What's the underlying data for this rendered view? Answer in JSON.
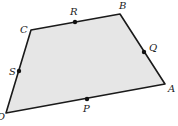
{
  "diagram": {
    "type": "quadrilateral",
    "fill_color": "#e6e6e6",
    "stroke_color": "#1a1a1a",
    "vertices": [
      {
        "label": "A",
        "x": 165,
        "y": 84,
        "lx": 168,
        "ly": 92
      },
      {
        "label": "B",
        "x": 120,
        "y": 14,
        "lx": 119,
        "ly": 9
      },
      {
        "label": "C",
        "x": 31,
        "y": 30,
        "lx": 20,
        "ly": 33
      },
      {
        "label": "D",
        "x": 6,
        "y": 113,
        "lx": -3,
        "ly": 120
      }
    ],
    "midpoints": [
      {
        "label": "P",
        "x": 87,
        "y": 99,
        "lx": 83,
        "ly": 112
      },
      {
        "label": "Q",
        "x": 144,
        "y": 52,
        "lx": 149,
        "ly": 51
      },
      {
        "label": "R",
        "x": 75,
        "y": 22,
        "lx": 70,
        "ly": 15
      },
      {
        "label": "S",
        "x": 19,
        "y": 71,
        "lx": 9,
        "ly": 75
      }
    ]
  }
}
